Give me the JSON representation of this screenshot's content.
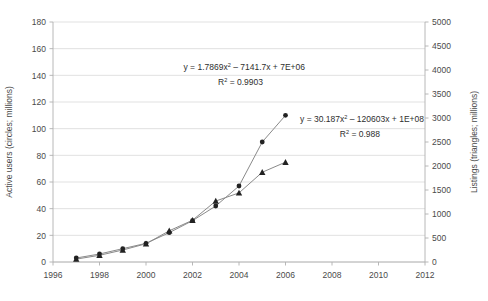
{
  "chart_data": {
    "type": "line",
    "title": "",
    "xlabel": "",
    "ylabel": "Active users (circles; millions)",
    "y2label": "Listings (triangles; millions)",
    "xlim": [
      1996,
      2012
    ],
    "ylim": [
      0,
      180
    ],
    "y2lim": [
      0,
      5000
    ],
    "grid": true,
    "legend": "none",
    "x_ticks": [
      "1996",
      "1998",
      "2000",
      "2002",
      "2004",
      "2006",
      "2008",
      "2010",
      "2012"
    ],
    "x_tick_values": [
      1996,
      1998,
      2000,
      2002,
      2004,
      2006,
      2008,
      2010,
      2012
    ],
    "y_ticks": [
      "0",
      "20",
      "40",
      "60",
      "80",
      "100",
      "120",
      "140",
      "160",
      "180"
    ],
    "y_tick_values": [
      0,
      20,
      40,
      60,
      80,
      100,
      120,
      140,
      160,
      180
    ],
    "y2_ticks": [
      "0",
      "500",
      "1000",
      "1500",
      "2000",
      "2500",
      "3000",
      "3500",
      "4000",
      "4500",
      "5000"
    ],
    "y2_tick_values": [
      0,
      500,
      1000,
      1500,
      2000,
      2500,
      3000,
      3500,
      4000,
      4500,
      5000
    ],
    "x": [
      1997,
      1998,
      1999,
      2000,
      2001,
      2002,
      2003,
      2004,
      2005,
      2006
    ],
    "series": [
      {
        "name": "Active users",
        "marker": "circle",
        "axis": "left",
        "values": [
          3,
          6,
          10,
          14,
          22,
          31,
          42,
          57,
          90,
          110
        ]
      },
      {
        "name": "Listings",
        "marker": "triangle",
        "axis": "right",
        "values": [
          60,
          140,
          250,
          380,
          650,
          870,
          1270,
          1440,
          1870,
          2080
        ]
      }
    ],
    "annotations": [
      {
        "id": "users-fit",
        "equation_prefix": "y = 1.7869x",
        "equation_exponent": "2",
        "equation_suffix": " – 7141.7x + 7E+06",
        "r2_prefix": "R",
        "r2_exponent": "2",
        "r2_suffix": " = 0.9903"
      },
      {
        "id": "listings-fit",
        "equation_prefix": "y = 30.187x",
        "equation_exponent": "2",
        "equation_suffix": " – 120603x + 1E+08",
        "r2_prefix": "R",
        "r2_exponent": "2",
        "r2_suffix": " = 0.988"
      }
    ],
    "trendlines": [
      {
        "name": "users-trend",
        "style": "dashed",
        "color": "#d2d2d2"
      },
      {
        "name": "listings-trend",
        "style": "dashed",
        "color": "#d2d2d2"
      }
    ],
    "colors": {
      "marker": "#222222",
      "series_line": "#8a8a8a",
      "grid": "#d9d9d9",
      "axis": "#b0b0b0",
      "trend": "#d2d2d2",
      "text": "#4a4a4a",
      "background": "#ffffff"
    }
  }
}
